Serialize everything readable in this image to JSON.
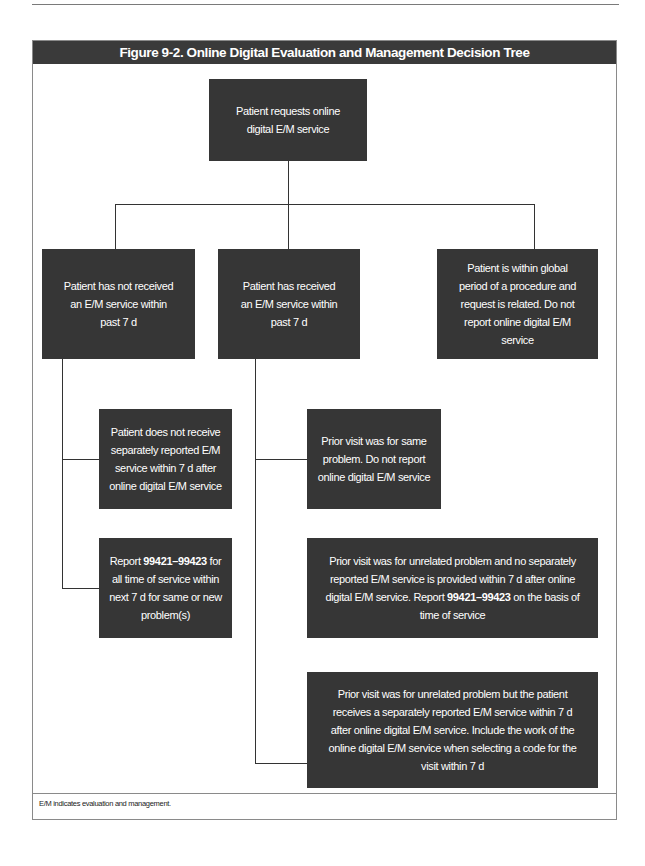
{
  "page": {
    "running_label": "Chapter 9"
  },
  "figure": {
    "title": "Figure 9-2. Online Digital Evaluation and Management Decision Tree",
    "footnote": "E/M indicates evaluation and management.",
    "colors": {
      "header_bg": "#3a3a3a",
      "node_bg": "#363636",
      "node_text": "#ffffff",
      "connector": "#333333"
    },
    "nodes": {
      "root": {
        "text": "Patient requests online digital E/M service"
      },
      "branch_not_received": {
        "text": "Patient has not received an E/M service within past 7 d"
      },
      "branch_received": {
        "text": "Patient has received an E/M service within past 7 d"
      },
      "branch_global_period": {
        "text": "Patient is within global period of a procedure and request is related. Do not report online digital E/M service"
      },
      "not_received_no_separate_em": {
        "text": "Patient does not receive separately reported E/M service within 7 d after online digital E/M service"
      },
      "not_received_report": {
        "prefix": "Report ",
        "code": "99421–99423",
        "suffix": " for all time of service within next 7 d for same or new problem(s)"
      },
      "received_same_problem": {
        "text": "Prior visit was for same problem. Do not report online digital E/M service"
      },
      "received_unrelated_no_separate": {
        "prefix": "Prior visit was for unrelated problem and no separately reported E/M service is provided within 7 d after online digital E/M service. Report ",
        "code": "99421–99423",
        "suffix": " on the basis of time of service"
      },
      "received_unrelated_with_separate": {
        "text": "Prior visit was for unrelated problem but the patient receives a separately reported E/M service within 7 d after online digital E/M service. Include the work of the online digital E/M service when selecting a code for the visit within 7 d"
      }
    }
  }
}
